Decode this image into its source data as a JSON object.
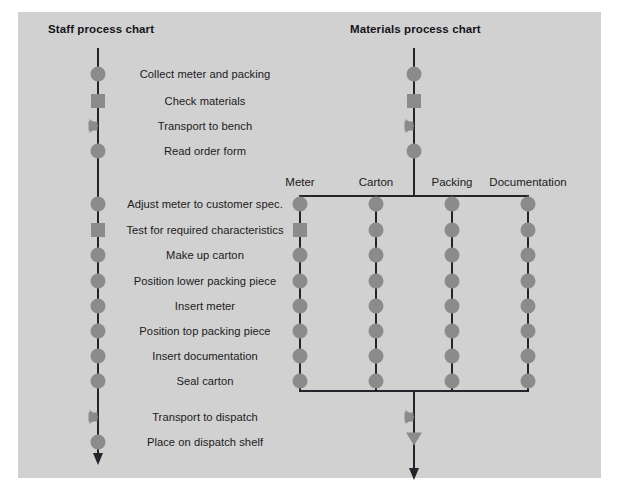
{
  "figure": {
    "background_color": "#d1d1d1",
    "symbol_color": "#8b8b8b",
    "line_color": "#24242a"
  },
  "staff_chart": {
    "title": "Staff process chart",
    "axis_x": 98,
    "line_top": 48,
    "line_bottom": 455,
    "steps": [
      {
        "label": "Collect meter and packing",
        "symbol": "operation",
        "y": 74
      },
      {
        "label": "Check materials",
        "symbol": "inspection",
        "y": 101
      },
      {
        "label": "Transport to bench",
        "symbol": "transport",
        "y": 126
      },
      {
        "label": "Read order form",
        "symbol": "operation",
        "y": 151
      },
      {
        "label": "Adjust meter to customer spec.",
        "symbol": "operation",
        "y": 204
      },
      {
        "label": "Test for required characteristics",
        "symbol": "inspection",
        "y": 230
      },
      {
        "label": "Make up carton",
        "symbol": "operation",
        "y": 255
      },
      {
        "label": "Position lower packing piece",
        "symbol": "operation",
        "y": 281
      },
      {
        "label": "Insert meter",
        "symbol": "operation",
        "y": 306
      },
      {
        "label": "Position top packing piece",
        "symbol": "operation",
        "y": 331
      },
      {
        "label": "Insert documentation",
        "symbol": "operation",
        "y": 356
      },
      {
        "label": "Seal carton",
        "symbol": "operation",
        "y": 381
      },
      {
        "label": "Transport to dispatch",
        "symbol": "transport",
        "y": 417
      },
      {
        "label": "Place on dispatch shelf",
        "symbol": "operation",
        "y": 442
      }
    ]
  },
  "materials_chart": {
    "title": "Materials process chart",
    "axis_x": 414,
    "line_top": 48,
    "split_y": 196,
    "merge_y": 391,
    "line_bottom": 470,
    "branch_left": 300,
    "branch_right": 528,
    "head_steps": [
      {
        "symbol": "operation",
        "y": 74
      },
      {
        "symbol": "inspection",
        "y": 101
      },
      {
        "symbol": "transport",
        "y": 126
      },
      {
        "symbol": "operation",
        "y": 151
      }
    ],
    "tail_steps": [
      {
        "symbol": "transport",
        "y": 417
      },
      {
        "symbol": "storage",
        "y": 442
      }
    ],
    "columns": [
      {
        "header": "Meter",
        "x": 300,
        "symbols": [
          {
            "symbol": "operation",
            "y": 204
          },
          {
            "symbol": "inspection",
            "y": 230
          },
          {
            "symbol": "operation",
            "y": 255
          },
          {
            "symbol": "operation",
            "y": 281
          },
          {
            "symbol": "operation",
            "y": 306
          },
          {
            "symbol": "operation",
            "y": 331
          },
          {
            "symbol": "operation",
            "y": 356
          },
          {
            "symbol": "operation",
            "y": 381
          }
        ]
      },
      {
        "header": "Carton",
        "x": 376,
        "symbols": [
          {
            "symbol": "operation",
            "y": 204
          },
          {
            "symbol": "operation",
            "y": 230
          },
          {
            "symbol": "operation",
            "y": 255
          },
          {
            "symbol": "operation",
            "y": 281
          },
          {
            "symbol": "operation",
            "y": 306
          },
          {
            "symbol": "operation",
            "y": 331
          },
          {
            "symbol": "operation",
            "y": 356
          },
          {
            "symbol": "operation",
            "y": 381
          }
        ]
      },
      {
        "header": "Packing",
        "x": 452,
        "symbols": [
          {
            "symbol": "operation",
            "y": 204
          },
          {
            "symbol": "operation",
            "y": 230
          },
          {
            "symbol": "operation",
            "y": 255
          },
          {
            "symbol": "operation",
            "y": 281
          },
          {
            "symbol": "operation",
            "y": 306
          },
          {
            "symbol": "operation",
            "y": 331
          },
          {
            "symbol": "operation",
            "y": 356
          },
          {
            "symbol": "operation",
            "y": 381
          }
        ]
      },
      {
        "header": "Documentation",
        "x": 528,
        "symbols": [
          {
            "symbol": "operation",
            "y": 204
          },
          {
            "symbol": "operation",
            "y": 230
          },
          {
            "symbol": "operation",
            "y": 255
          },
          {
            "symbol": "operation",
            "y": 281
          },
          {
            "symbol": "operation",
            "y": 306
          },
          {
            "symbol": "operation",
            "y": 331
          },
          {
            "symbol": "operation",
            "y": 356
          },
          {
            "symbol": "operation",
            "y": 381
          }
        ]
      }
    ],
    "column_header_y": 176
  },
  "labels": {
    "center_x": 205
  }
}
